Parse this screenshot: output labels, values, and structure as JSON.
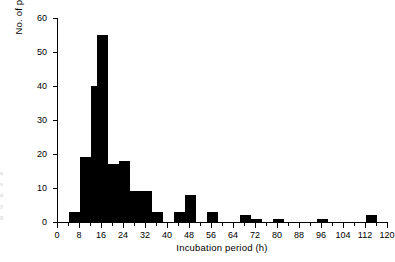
{
  "figure": {
    "background_color": "#ffffff",
    "bar_color": "#000000",
    "axis_color": "#000000",
    "edge_fragment_lines": [
      "s",
      "x",
      "d",
      "y",
      "g"
    ]
  },
  "chart_data": {
    "type": "bar",
    "title": "",
    "xlabel": "Incubation period  (h)",
    "ylabel": "No. of people",
    "xlim": [
      0,
      120
    ],
    "ylim": [
      0,
      60
    ],
    "bin_width": 4,
    "grid": false,
    "legend": null,
    "xticks_major": [
      0,
      8,
      16,
      24,
      32,
      40,
      48,
      56,
      64,
      72,
      80,
      88,
      96,
      104,
      112,
      120
    ],
    "xtick_labels": [
      "0",
      "8",
      "16",
      "24",
      "32",
      "40",
      "48",
      "56",
      "64",
      "72",
      "80",
      "88",
      "96",
      "104",
      "112",
      "120"
    ],
    "xticks_minor": [
      4,
      12,
      20,
      28,
      36,
      44,
      52,
      60,
      68,
      76,
      84,
      92,
      100,
      108,
      116
    ],
    "yticks": [
      0,
      10,
      20,
      30,
      40,
      50,
      60
    ],
    "ytick_labels": [
      "0",
      "10",
      "20",
      "30",
      "40",
      "50",
      "60"
    ],
    "bin_edges": [
      4,
      8,
      12,
      16,
      20,
      24,
      28,
      32,
      36,
      40,
      44,
      48,
      52,
      56,
      60,
      64,
      68,
      72,
      76,
      80,
      84,
      88,
      92,
      96,
      100,
      104,
      108,
      112,
      116
    ],
    "categories": [
      "4-8",
      "8-12",
      "12-16",
      "16-20",
      "20-24",
      "24-28",
      "28-32",
      "32-36",
      "36-40",
      "40-44",
      "44-48",
      "48-52",
      "52-56",
      "56-60",
      "60-64",
      "64-68",
      "68-72",
      "72-76",
      "76-80",
      "80-84",
      "84-88",
      "88-92",
      "92-96",
      "96-100",
      "100-104",
      "104-108",
      "108-112",
      "112-116"
    ],
    "values": [
      3,
      19,
      40,
      55,
      17,
      18,
      9,
      9,
      3,
      0,
      3,
      8,
      0,
      3,
      0,
      0,
      2,
      1,
      0,
      1,
      0,
      0,
      0,
      1,
      0,
      0,
      0,
      2
    ],
    "bars": [
      {
        "x0": 4,
        "x1": 8,
        "value": 3
      },
      {
        "x0": 8,
        "x1": 12,
        "value": 19
      },
      {
        "x0": 12,
        "x1": 14,
        "value": 40
      },
      {
        "x0": 14,
        "x1": 18,
        "value": 55
      },
      {
        "x0": 18,
        "x1": 22,
        "value": 17
      },
      {
        "x0": 22,
        "x1": 26,
        "value": 18
      },
      {
        "x0": 26,
        "x1": 30,
        "value": 9
      },
      {
        "x0": 30,
        "x1": 34,
        "value": 9
      },
      {
        "x0": 34,
        "x1": 38,
        "value": 3
      },
      {
        "x0": 42,
        "x1": 46,
        "value": 3
      },
      {
        "x0": 46,
        "x1": 50,
        "value": 8
      },
      {
        "x0": 54,
        "x1": 58,
        "value": 3
      },
      {
        "x0": 66,
        "x1": 70,
        "value": 2
      },
      {
        "x0": 70,
        "x1": 74,
        "value": 1
      },
      {
        "x0": 78,
        "x1": 82,
        "value": 1
      },
      {
        "x0": 94,
        "x1": 98,
        "value": 1
      },
      {
        "x0": 112,
        "x1": 116,
        "value": 2
      }
    ]
  }
}
